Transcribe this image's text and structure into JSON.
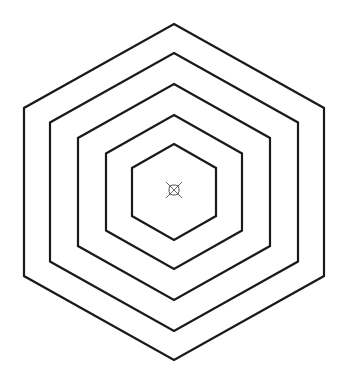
{
  "diagram": {
    "background": "#ffffff",
    "stroke_color": "#1a1a1a",
    "center": {
      "x": 174,
      "y": 192
    },
    "hexagons": [
      {
        "name": "hexagon-1-outer",
        "half_width": 150,
        "half_height": 168,
        "stroke_width": 2.2
      },
      {
        "name": "hexagon-2",
        "half_width": 124,
        "half_height": 139,
        "stroke_width": 2.2
      },
      {
        "name": "hexagon-3",
        "half_width": 96,
        "half_height": 108,
        "stroke_width": 2.2
      },
      {
        "name": "hexagon-4",
        "half_width": 68,
        "half_height": 77,
        "stroke_width": 2.2
      },
      {
        "name": "hexagon-5-inner",
        "half_width": 42,
        "half_height": 48,
        "stroke_width": 2.2
      }
    ],
    "center_marker": {
      "icon": "circle-x-marker-icon",
      "x": 174,
      "y": 190,
      "size": 16,
      "color": "#555555"
    }
  }
}
